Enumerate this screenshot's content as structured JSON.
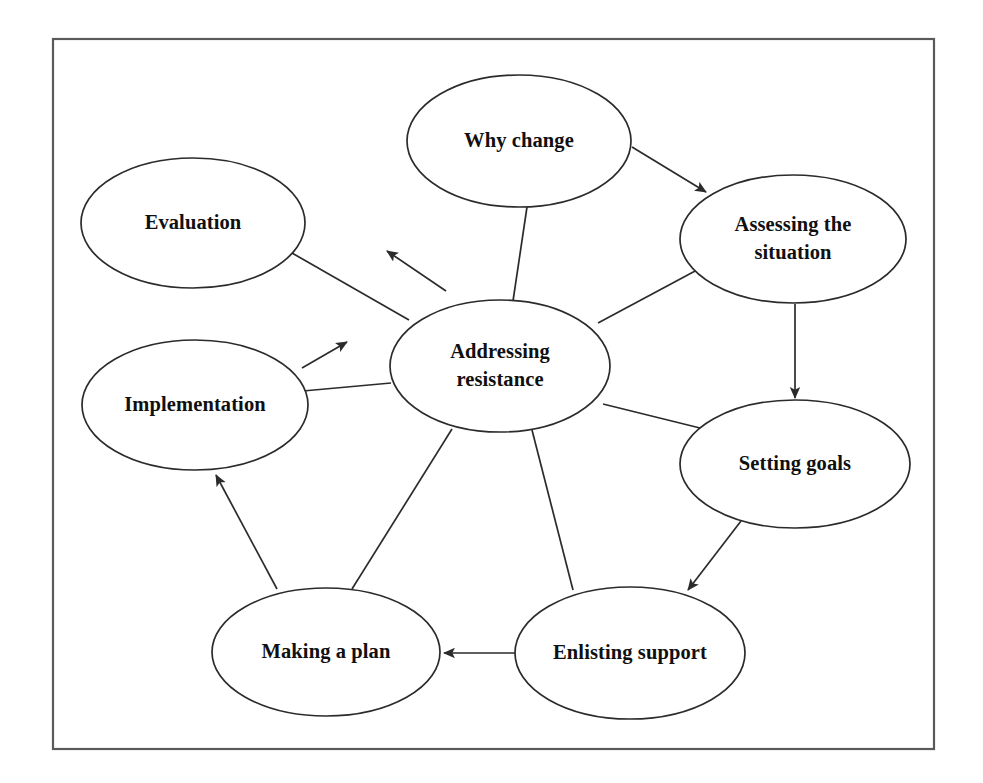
{
  "figure": {
    "background_color": "#ffffff",
    "frame_color": "#5a5a5a",
    "stroke_color": "#2b2b2b",
    "text_color": "#101010"
  },
  "nodes": {
    "why_change": {
      "label": "Why change",
      "cx": 519,
      "cy": 141,
      "rx": 112,
      "ry": 66
    },
    "assessing": {
      "label_line1": "Assessing the",
      "label_line2": "situation",
      "cx": 793,
      "cy": 239,
      "rx": 113,
      "ry": 64
    },
    "setting_goals": {
      "label": "Setting goals",
      "cx": 795,
      "cy": 464,
      "rx": 115,
      "ry": 64
    },
    "enlisting_support": {
      "label": "Enlisting support",
      "cx": 630,
      "cy": 653,
      "rx": 115,
      "ry": 66
    },
    "making_a_plan": {
      "label": "Making a plan",
      "cx": 326,
      "cy": 652,
      "rx": 114,
      "ry": 64
    },
    "implementation": {
      "label": "Implementation",
      "cx": 195,
      "cy": 405,
      "rx": 113,
      "ry": 65
    },
    "evaluation": {
      "label": "Evaluation",
      "cx": 193,
      "cy": 223,
      "rx": 112,
      "ry": 65
    },
    "addressing_resistance": {
      "label_line1": "Addressing",
      "label_line2": "resistance",
      "cx": 500,
      "cy": 366,
      "rx": 110,
      "ry": 66
    }
  },
  "edges": [
    {
      "name": "why-change-to-assessing",
      "from": "why_change",
      "to": "assessing",
      "arrow": true
    },
    {
      "name": "assessing-to-setting-goals",
      "from": "assessing",
      "to": "setting_goals",
      "arrow": true
    },
    {
      "name": "setting-goals-to-enlisting-support",
      "from": "setting_goals",
      "to": "enlisting_support",
      "arrow": true
    },
    {
      "name": "enlisting-support-to-making-a-plan",
      "from": "enlisting_support",
      "to": "making_a_plan",
      "arrow": true
    },
    {
      "name": "making-a-plan-to-implementation",
      "from": "making_a_plan",
      "to": "implementation",
      "arrow": true
    },
    {
      "name": "implementation-to-evaluation",
      "from": "implementation",
      "to": "evaluation",
      "arrow": true
    },
    {
      "name": "spoke-center-to-why-change",
      "from": "addressing_resistance",
      "to": "why_change",
      "arrow": false
    },
    {
      "name": "spoke-center-to-assessing",
      "from": "addressing_resistance",
      "to": "assessing",
      "arrow": false
    },
    {
      "name": "spoke-center-to-setting-goals",
      "from": "addressing_resistance",
      "to": "setting_goals",
      "arrow": false
    },
    {
      "name": "spoke-center-to-enlisting-support",
      "from": "addressing_resistance",
      "to": "enlisting_support",
      "arrow": false
    },
    {
      "name": "spoke-center-to-making-a-plan",
      "from": "addressing_resistance",
      "to": "making_a_plan",
      "arrow": false
    },
    {
      "name": "spoke-center-to-implementation",
      "from": "addressing_resistance",
      "to": "implementation",
      "arrow": false
    },
    {
      "name": "spoke-center-to-evaluation",
      "from": "addressing_resistance",
      "to": "evaluation",
      "arrow": false
    }
  ]
}
